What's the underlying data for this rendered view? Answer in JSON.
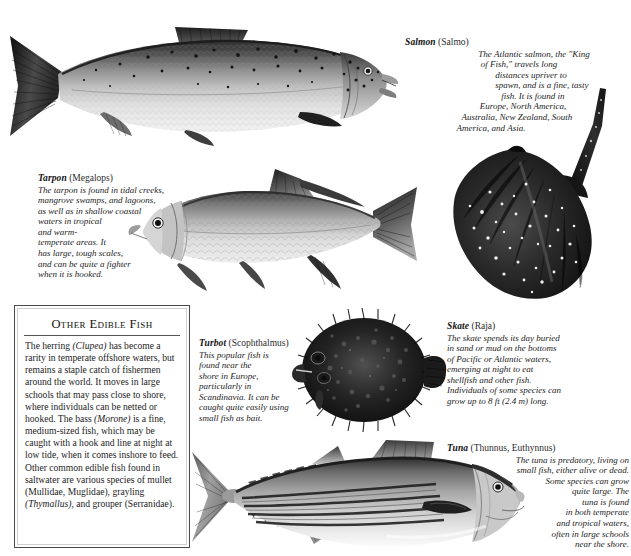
{
  "page": {
    "background": "#ffffff",
    "width": 631,
    "height": 556
  },
  "sidebar": {
    "title": "Other Edible Fish",
    "body": "The herring (Clupea) has become a rarity in temperate offshore waters, but remains a staple catch of fishermen around the world. It moves in large schools that may pass close to shore, where individuals can be netted or hooked. The bass (Morone) is a fine, medium-sized fish, which may be caught with a hook and line at night at low tide, when it comes inshore to feed. Other common edible fish found in saltwater are various species of mullet (Mullidae, Muglidae), grayling (Thymallus), and grouper (Serranidae)."
  },
  "species": [
    {
      "id": "salmon",
      "name": "Salmon",
      "genus": "(Salmo)",
      "lines": [
        "The Atlantic salmon, the \"King",
        "of Fish,\" travels long",
        "distances upriver to",
        "spawn, and is a fine, tasty",
        "fish. It is found in",
        "Europe, North America,",
        "Australia, New Zealand, South",
        "America, and Asia."
      ]
    },
    {
      "id": "tarpon",
      "name": "Tarpon",
      "genus": "(Megalops)",
      "lines": [
        "The tarpon is found in tidal creeks,",
        "mangrove swamps, and lagoons,",
        "as well as in shallow coastal",
        "waters in tropical",
        "and warm-",
        "temperate areas. It",
        "has large, tough scales,",
        "and can be quite a fighter",
        "when it is hooked."
      ]
    },
    {
      "id": "turbot",
      "name": "Turbot",
      "genus": "(Scophthalmus)",
      "lines": [
        "This popular fish is",
        "found near the",
        "shore in Europe,",
        "particularly in",
        "Scandinavia. It can be",
        "caught quite easily using",
        "small fish as bait."
      ]
    },
    {
      "id": "skate",
      "name": "Skate",
      "genus": "(Raja)",
      "lines": [
        "The skate spends its day buried",
        "in sand or mud on the bottoms",
        "of Pacific or Atlantic waters,",
        "emerging at night to eat",
        "shellfish and other fish.",
        "Individuals of some species can",
        "grow up to 8 ft (2.4 m) long."
      ]
    },
    {
      "id": "tuna",
      "name": "Tuna",
      "genus": "(Thunnus, Euthynnus)",
      "lines": [
        "The tuna is predatory, living on",
        "small fish, either alive or dead.",
        "Some species can grow",
        "quite large. The",
        "tuna is found",
        "in both temperate",
        "and tropical waters,",
        "often in large schools",
        "near the shore."
      ]
    }
  ]
}
